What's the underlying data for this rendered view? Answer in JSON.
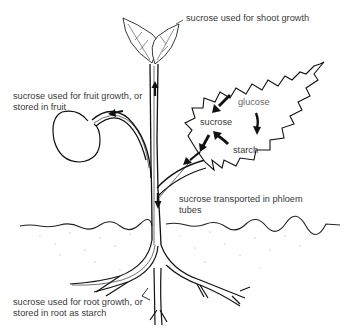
{
  "diagram": {
    "labels": {
      "shoot": "sucrose used for shoot growth",
      "fruit_line1": "sucrose used for fruit growth, or",
      "fruit_line2": "stored in fruit",
      "glucose": "glucose",
      "sucrose_leaf": "sucrose",
      "starch": "starch",
      "phloem_line1": "sucrose transported in phloem",
      "phloem_line2": "tubes",
      "root_line1": "sucrose used for root growth, or",
      "root_line2": "stored in root as starch"
    },
    "parts": [
      "shoot-leaves",
      "stem",
      "fruit",
      "leaf",
      "soil-line",
      "roots"
    ],
    "arrows": [
      {
        "id": "stem-up",
        "direction": "up",
        "meaning": "sucrose to shoot"
      },
      {
        "id": "fruit-stalk",
        "direction": "left",
        "meaning": "sucrose to fruit"
      },
      {
        "id": "glucose-to-sucrose",
        "direction": "down-left"
      },
      {
        "id": "glucose-to-starch",
        "direction": "down"
      },
      {
        "id": "starch-to-sucrose",
        "direction": "up-left"
      },
      {
        "id": "leaf-to-stem",
        "direction": "down-left"
      },
      {
        "id": "stem-down",
        "direction": "down",
        "meaning": "sucrose to roots"
      }
    ],
    "colors": {
      "line": "#1a1a1a",
      "text": "#3a3a3a",
      "background": "#ffffff"
    }
  }
}
